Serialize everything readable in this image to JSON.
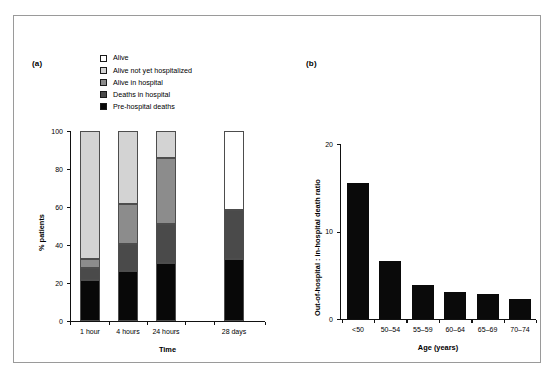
{
  "figure": {
    "background": "#ffffff",
    "frame_color": "#9a9a9a"
  },
  "panel_a": {
    "label": "(a)",
    "legend": {
      "items": [
        {
          "label": "Alive",
          "color": "#ffffff"
        },
        {
          "label": "Alive not yet hospitalized",
          "color": "#d3d3d3"
        },
        {
          "label": "Alive in hospital",
          "color": "#8c8c8c"
        },
        {
          "label": "Deaths in hospital",
          "color": "#4a4a4a"
        },
        {
          "label": "Pre-hospital deaths",
          "color": "#080808"
        }
      ]
    }
  },
  "panel_b": {
    "label": "(b)"
  },
  "chart_data": [
    {
      "type": "bar",
      "stacked": true,
      "panel": "(a)",
      "title": "",
      "xlabel": "Time",
      "ylabel": "% patients",
      "ylim": [
        0,
        100
      ],
      "yticks": [
        0,
        20,
        40,
        60,
        80,
        100
      ],
      "ytick_labels": [
        "0",
        "20",
        "40",
        "60",
        "80",
        "100"
      ],
      "grid": false,
      "legend_position": "top-center",
      "categories": [
        "1 hour",
        "4 hours",
        "24 hours",
        "28 days"
      ],
      "series": [
        {
          "name": "Pre-hospital deaths",
          "color": "#080808",
          "values": [
            21.5,
            26.5,
            30.5,
            32.5
          ]
        },
        {
          "name": "Deaths in hospital",
          "color": "#4a4a4a",
          "values": [
            6.5,
            14.0,
            20.5,
            26.0
          ]
        },
        {
          "name": "Alive in hospital",
          "color": "#8c8c8c",
          "values": [
            4.5,
            21.0,
            35.0,
            0
          ]
        },
        {
          "name": "Alive not yet hospitalized",
          "color": "#d3d3d3",
          "values": [
            67.5,
            38.5,
            14.0,
            0
          ]
        },
        {
          "name": "Alive",
          "color": "#ffffff",
          "values": [
            0,
            0,
            0,
            41.5
          ]
        }
      ]
    },
    {
      "type": "bar",
      "stacked": false,
      "panel": "(b)",
      "title": "",
      "xlabel": "Age (years)",
      "ylabel": "Out-of-hospital : in-hospital death ratio",
      "ylim": [
        0,
        20
      ],
      "yticks": [
        0,
        10,
        20
      ],
      "ytick_labels": [
        "0",
        "10",
        "20"
      ],
      "grid": false,
      "bar_color": "#0a0a0a",
      "categories": [
        "<50",
        "50–54",
        "55–59",
        "60–64",
        "65–69",
        "70–74"
      ],
      "values": [
        15.5,
        6.6,
        3.9,
        3.1,
        2.9,
        2.3
      ]
    }
  ]
}
